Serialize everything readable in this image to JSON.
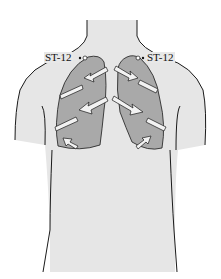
{
  "figure": {
    "colors": {
      "background": "#ffffff",
      "body_fill": "#e6e6e6",
      "lung_fill": "#a9a9a9",
      "outline": "#1a1a1a",
      "arrow_fill": "#f2f2f2"
    }
  },
  "labels": {
    "left_point": "ST-12",
    "right_point": "ST-12"
  }
}
